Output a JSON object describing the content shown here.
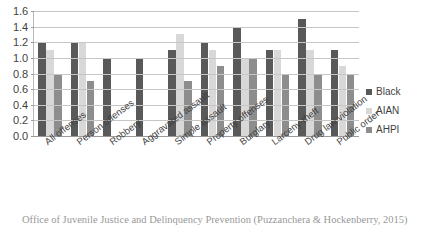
{
  "figure": {
    "title_sliver": "",
    "caption": "Office of Juvenile Justice and Delinquency Prevention (Puzzanchera & Hockenberry, 2015)"
  },
  "legend": {
    "position": "right",
    "entries": [
      {
        "label": "Black",
        "color": "#595959"
      },
      {
        "label": "AIAN",
        "color": "#d8d8d8"
      },
      {
        "label": "AHPI",
        "color": "#8d8d8d"
      }
    ]
  },
  "axis": {
    "y_ticks": [
      "0.0",
      "0.2",
      "0.4",
      "0.6",
      "0.8",
      "1.0",
      "1.2",
      "1.4",
      "1.6"
    ],
    "y_min": 0.0,
    "y_max": 1.6,
    "y_step": 0.2
  },
  "chart_data": {
    "type": "bar",
    "title": "",
    "xlabel": "",
    "ylabel": "",
    "ylim": [
      0.0,
      1.6
    ],
    "ytick_step": 0.2,
    "grid": true,
    "legend_position": "right",
    "categories": [
      "All offenses",
      "Person offenses",
      "Robbery",
      "Aggravated assault",
      "Simple assault",
      "Property offenses",
      "Burglary",
      "Larceny-theft",
      "Drug law violation",
      "Public order"
    ],
    "series": [
      {
        "name": "Black",
        "color": "#595959",
        "values": [
          1.2,
          1.2,
          1.0,
          1.0,
          1.1,
          1.2,
          1.4,
          1.1,
          1.5,
          1.1
        ]
      },
      {
        "name": "AIAN",
        "color": "#d8d8d8",
        "values": [
          1.1,
          1.2,
          null,
          null,
          1.3,
          1.1,
          1.0,
          1.1,
          1.1,
          0.9
        ]
      },
      {
        "name": "AHPI",
        "color": "#8d8d8d",
        "values": [
          0.8,
          0.7,
          null,
          null,
          0.7,
          0.9,
          1.0,
          0.8,
          0.8,
          0.8
        ]
      }
    ]
  }
}
